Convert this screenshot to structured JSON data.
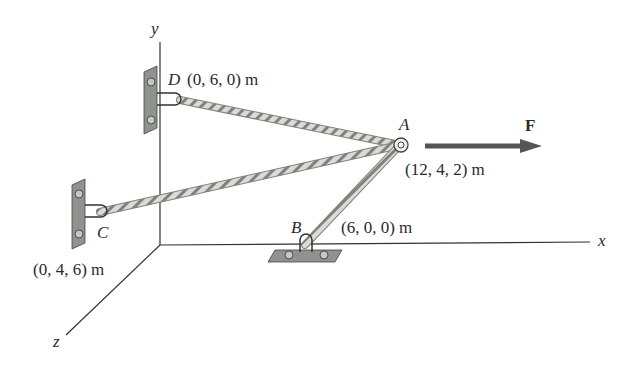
{
  "figure": {
    "axes": {
      "x": "x",
      "y": "y",
      "z": "z"
    },
    "points": {
      "A": {
        "name": "A",
        "coords": "(12, 4, 2) m"
      },
      "B": {
        "name": "B",
        "coords": "(6, 0, 0) m"
      },
      "C": {
        "name": "C",
        "coords": "(0, 4, 6) m"
      },
      "D": {
        "name": "D",
        "coords": "(0, 6, 0) m"
      }
    },
    "force": {
      "label": "F"
    },
    "colors": {
      "line": "#333333",
      "rope": "#cfd2cc",
      "rope_edge": "#7f837c",
      "bracket": "#8f938d",
      "arrow": "#555555"
    }
  }
}
